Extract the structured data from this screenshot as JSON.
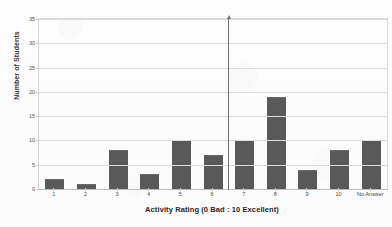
{
  "chart_data": {
    "type": "bar",
    "title": "",
    "xlabel": "Activity Rating (0 Bad : 10 Excellent)",
    "ylabel": "Number of Students",
    "categories": [
      "1",
      "2",
      "3",
      "4",
      "5",
      "6",
      "7",
      "8",
      "9",
      "10",
      "No Answer"
    ],
    "values": [
      2,
      1,
      8,
      3,
      10,
      7,
      10,
      19,
      4,
      8,
      10
    ],
    "ylim": [
      0,
      35
    ],
    "ytick_values": [
      0,
      5,
      10,
      15,
      20,
      25,
      30,
      35
    ],
    "ytick_labels": [
      "0",
      "5",
      "10",
      "15",
      "20",
      "25",
      "30",
      "35"
    ],
    "grid": "horizontal",
    "legend": "none",
    "bar_color": "#595959",
    "gridline_color": "#dcdcdc",
    "plot_border_color": "#d8d8d8",
    "annotations": [
      {
        "name": "vertical-marker-arrow",
        "description": "vertical line with upward arrowhead between categories 6 and 7",
        "between_categories": [
          "6",
          "7"
        ],
        "color": "#6f6f6f"
      }
    ]
  }
}
